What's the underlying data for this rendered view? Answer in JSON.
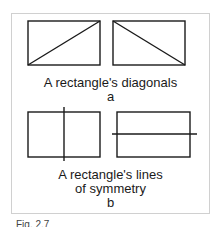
{
  "figure": {
    "part_a": {
      "caption": "A rectangle's diagonals",
      "letter": "a",
      "shapes": [
        {
          "type": "rectangle-with-diagonal",
          "diagonal": "bottom-left to top-right"
        },
        {
          "type": "rectangle-with-diagonal",
          "diagonal": "top-left to bottom-right"
        }
      ]
    },
    "part_b": {
      "caption_line1": "A rectangle's lines",
      "caption_line2": "of symmetry",
      "letter": "b",
      "shapes": [
        {
          "type": "rectangle-with-symmetry-line",
          "line": "vertical"
        },
        {
          "type": "rectangle-with-symmetry-line",
          "line": "horizontal"
        }
      ]
    },
    "figure_caption": "Fig. 2.7"
  },
  "colors": {
    "stroke": "#1a1a1a",
    "frame": "#d0d0d0"
  }
}
